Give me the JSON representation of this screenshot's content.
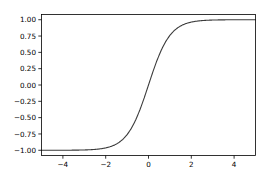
{
  "figure": {
    "width": 267,
    "height": 180,
    "background_color": "#ffffff"
  },
  "chart_data": {
    "type": "line",
    "title": "",
    "xlabel": "",
    "ylabel": "",
    "xlim": [
      -5.0,
      5.0
    ],
    "ylim": [
      -1.08,
      1.08
    ],
    "grid": false,
    "legend": null,
    "line_color": "#3b3b3b",
    "xticks": [
      -4,
      -2,
      0,
      2,
      4
    ],
    "xtick_labels": [
      "−4",
      "−2",
      "0",
      "2",
      "4"
    ],
    "yticks": [
      -1.0,
      -0.75,
      -0.5,
      -0.25,
      0.0,
      0.25,
      0.5,
      0.75,
      1.0
    ],
    "ytick_labels": [
      "−1.00",
      "−0.75",
      "−0.50",
      "−0.25",
      "0.00",
      "0.25",
      "0.50",
      "0.75",
      "1.00"
    ],
    "series": [
      {
        "name": "tanh(x)",
        "x": [
          -5.0,
          -4.8,
          -4.6,
          -4.4,
          -4.2,
          -4.0,
          -3.8,
          -3.6,
          -3.4,
          -3.2,
          -3.0,
          -2.8,
          -2.6,
          -2.4,
          -2.2,
          -2.0,
          -1.8,
          -1.6,
          -1.4,
          -1.2,
          -1.0,
          -0.8,
          -0.6,
          -0.4,
          -0.2,
          0.0,
          0.2,
          0.4,
          0.6,
          0.8,
          1.0,
          1.2,
          1.4,
          1.6,
          1.8,
          2.0,
          2.2,
          2.4,
          2.6,
          2.8,
          3.0,
          3.2,
          3.4,
          3.6,
          3.8,
          4.0,
          4.2,
          4.4,
          4.6,
          4.8,
          5.0
        ],
        "y": [
          -0.9999,
          -0.9999,
          -0.9998,
          -0.9998,
          -0.9996,
          -0.9993,
          -0.999,
          -0.9985,
          -0.9978,
          -0.9967,
          -0.9951,
          -0.9926,
          -0.989,
          -0.9837,
          -0.9757,
          -0.964,
          -0.9468,
          -0.9217,
          -0.8854,
          -0.8337,
          -0.7616,
          -0.664,
          -0.537,
          -0.3799,
          -0.1974,
          0.0,
          0.1974,
          0.3799,
          0.537,
          0.664,
          0.7616,
          0.8337,
          0.8854,
          0.9217,
          0.9468,
          0.964,
          0.9757,
          0.9837,
          0.989,
          0.9926,
          0.9951,
          0.9967,
          0.9978,
          0.9985,
          0.999,
          0.9993,
          0.9996,
          0.9998,
          0.9998,
          0.9999,
          0.9999
        ]
      }
    ]
  }
}
